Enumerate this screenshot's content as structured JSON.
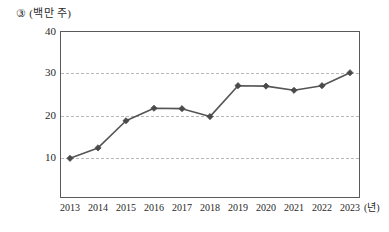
{
  "caption": {
    "item_number": "③",
    "unit": "(백만 주)"
  },
  "axis": {
    "x_unit": "(년)",
    "y_ticks": [
      "10",
      "20",
      "30",
      "40"
    ],
    "x_ticks": [
      "2013",
      "2014",
      "2015",
      "2016",
      "2017",
      "2018",
      "2019",
      "2020",
      "2021",
      "2022",
      "2023"
    ]
  },
  "style": {
    "line_color": "#555555",
    "marker_color": "#4a4a4a",
    "grid_color": "#b9b9b9",
    "axis_color": "#5a5a5a",
    "background": "#ffffff"
  },
  "chart_data": {
    "type": "line",
    "title": "",
    "subtitle": "",
    "xlabel": "(년)",
    "ylabel": "(백만 주)",
    "categories": [
      "2013",
      "2014",
      "2015",
      "2016",
      "2017",
      "2018",
      "2019",
      "2020",
      "2021",
      "2022",
      "2023"
    ],
    "values": [
      9.5,
      12.0,
      18.5,
      21.5,
      21.4,
      19.5,
      26.9,
      26.8,
      25.8,
      26.9,
      30.0
    ],
    "series": [
      {
        "name": "주식 수",
        "values": [
          9.5,
          12.0,
          18.5,
          21.5,
          21.4,
          19.5,
          26.9,
          26.8,
          25.8,
          26.9,
          30.0
        ]
      }
    ],
    "xlim": [
      2013,
      2023
    ],
    "ylim": [
      0,
      40
    ],
    "ytick_values": [
      10,
      20,
      30,
      40
    ],
    "grid": true,
    "grid_axis": "y",
    "grid_style": "dashed",
    "legend": false,
    "legend_position": "none",
    "marker": "diamond",
    "annotations": []
  }
}
